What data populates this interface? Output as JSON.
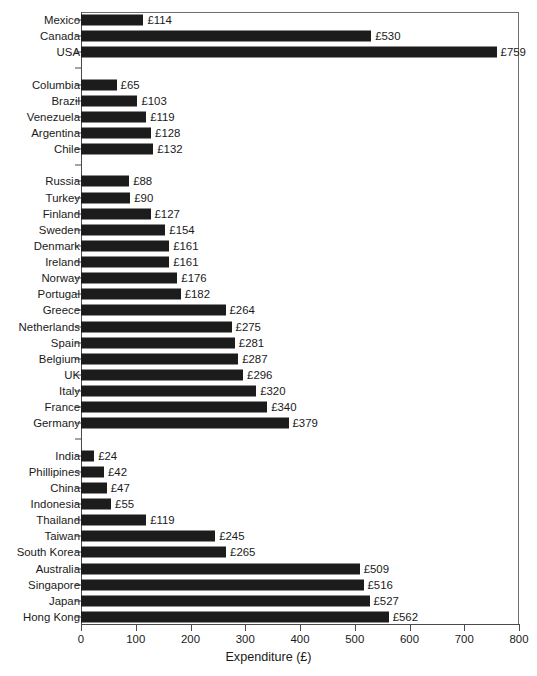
{
  "chart_data": {
    "type": "bar",
    "orientation": "horizontal",
    "title": "",
    "xlabel": "Expenditure (£)",
    "ylabel": "",
    "xlim": [
      0,
      800
    ],
    "xticks": [
      0,
      100,
      200,
      300,
      400,
      500,
      600,
      700,
      800
    ],
    "xtick_labels": [
      "0",
      "100",
      "200",
      "300",
      "400",
      "500",
      "600",
      "700",
      "800"
    ],
    "grid": false,
    "legend": null,
    "value_prefix": "£",
    "bar_color": "#1c1c1c",
    "categories": [
      "Mexico",
      "Canada",
      "USA",
      "Columbia",
      "Brazil",
      "Venezuela",
      "Argentina",
      "Chile",
      "Russia",
      "Turkey",
      "Finland",
      "Sweden",
      "Denmark",
      "Ireland",
      "Norway",
      "Portugal",
      "Greece",
      "Netherlands",
      "Spain",
      "Belgium",
      "UK",
      "Italy",
      "France",
      "Germany",
      "India",
      "Phillipines",
      "China",
      "Indonesia",
      "Thailand",
      "Taiwan",
      "South Korea",
      "Australia",
      "Singapore",
      "Japan",
      "Hong Kong"
    ],
    "values": [
      114,
      530,
      759,
      65,
      103,
      119,
      128,
      132,
      88,
      90,
      127,
      154,
      161,
      161,
      176,
      182,
      264,
      275,
      281,
      287,
      296,
      320,
      340,
      379,
      24,
      42,
      47,
      55,
      119,
      245,
      265,
      509,
      516,
      527,
      562
    ],
    "value_labels": [
      "£114",
      "£530",
      "£759",
      "£65",
      "£103",
      "£119",
      "£128",
      "£132",
      "£88",
      "£90",
      "£127",
      "£154",
      "£161",
      "£161",
      "£176",
      "£182",
      "£264",
      "£275",
      "£281",
      "£287",
      "£296",
      "£320",
      "£340",
      "£379",
      "£24",
      "£42",
      "£47",
      "£55",
      "£119",
      "£245",
      "£265",
      "£509",
      "£516",
      "£527",
      "£562"
    ],
    "group_breaks_after": [
      2,
      7,
      23
    ],
    "rows": [
      {
        "label": "Mexico",
        "value": 114,
        "value_label": "£114",
        "spacer": false
      },
      {
        "label": "Canada",
        "value": 530,
        "value_label": "£530",
        "spacer": false
      },
      {
        "label": "USA",
        "value": 759,
        "value_label": "£759",
        "spacer": false
      },
      {
        "label": "",
        "value": null,
        "value_label": "",
        "spacer": true
      },
      {
        "label": "Columbia",
        "value": 65,
        "value_label": "£65",
        "spacer": false
      },
      {
        "label": "Brazil",
        "value": 103,
        "value_label": "£103",
        "spacer": false
      },
      {
        "label": "Venezuela",
        "value": 119,
        "value_label": "£119",
        "spacer": false
      },
      {
        "label": "Argentina",
        "value": 128,
        "value_label": "£128",
        "spacer": false
      },
      {
        "label": "Chile",
        "value": 132,
        "value_label": "£132",
        "spacer": false
      },
      {
        "label": "",
        "value": null,
        "value_label": "",
        "spacer": true
      },
      {
        "label": "Russia",
        "value": 88,
        "value_label": "£88",
        "spacer": false
      },
      {
        "label": "Turkey",
        "value": 90,
        "value_label": "£90",
        "spacer": false
      },
      {
        "label": "Finland",
        "value": 127,
        "value_label": "£127",
        "spacer": false
      },
      {
        "label": "Sweden",
        "value": 154,
        "value_label": "£154",
        "spacer": false
      },
      {
        "label": "Denmark",
        "value": 161,
        "value_label": "£161",
        "spacer": false
      },
      {
        "label": "Ireland",
        "value": 161,
        "value_label": "£161",
        "spacer": false
      },
      {
        "label": "Norway",
        "value": 176,
        "value_label": "£176",
        "spacer": false
      },
      {
        "label": "Portugal",
        "value": 182,
        "value_label": "£182",
        "spacer": false
      },
      {
        "label": "Greece",
        "value": 264,
        "value_label": "£264",
        "spacer": false
      },
      {
        "label": "Netherlands",
        "value": 275,
        "value_label": "£275",
        "spacer": false
      },
      {
        "label": "Spain",
        "value": 281,
        "value_label": "£281",
        "spacer": false
      },
      {
        "label": "Belgium",
        "value": 287,
        "value_label": "£287",
        "spacer": false
      },
      {
        "label": "UK",
        "value": 296,
        "value_label": "£296",
        "spacer": false
      },
      {
        "label": "Italy",
        "value": 320,
        "value_label": "£320",
        "spacer": false
      },
      {
        "label": "France",
        "value": 340,
        "value_label": "£340",
        "spacer": false
      },
      {
        "label": "Germany",
        "value": 379,
        "value_label": "£379",
        "spacer": false
      },
      {
        "label": "",
        "value": null,
        "value_label": "",
        "spacer": true
      },
      {
        "label": "India",
        "value": 24,
        "value_label": "£24",
        "spacer": false
      },
      {
        "label": "Phillipines",
        "value": 42,
        "value_label": "£42",
        "spacer": false
      },
      {
        "label": "China",
        "value": 47,
        "value_label": "£47",
        "spacer": false
      },
      {
        "label": "Indonesia",
        "value": 55,
        "value_label": "£55",
        "spacer": false
      },
      {
        "label": "Thailand",
        "value": 119,
        "value_label": "£119",
        "spacer": false
      },
      {
        "label": "Taiwan",
        "value": 245,
        "value_label": "£245",
        "spacer": false
      },
      {
        "label": "South Korea",
        "value": 265,
        "value_label": "£265",
        "spacer": false
      },
      {
        "label": "Australia",
        "value": 509,
        "value_label": "£509",
        "spacer": false
      },
      {
        "label": "Singapore",
        "value": 516,
        "value_label": "£516",
        "spacer": false
      },
      {
        "label": "Japan",
        "value": 527,
        "value_label": "£527",
        "spacer": false
      },
      {
        "label": "Hong Kong",
        "value": 562,
        "value_label": "£562",
        "spacer": false
      }
    ]
  }
}
